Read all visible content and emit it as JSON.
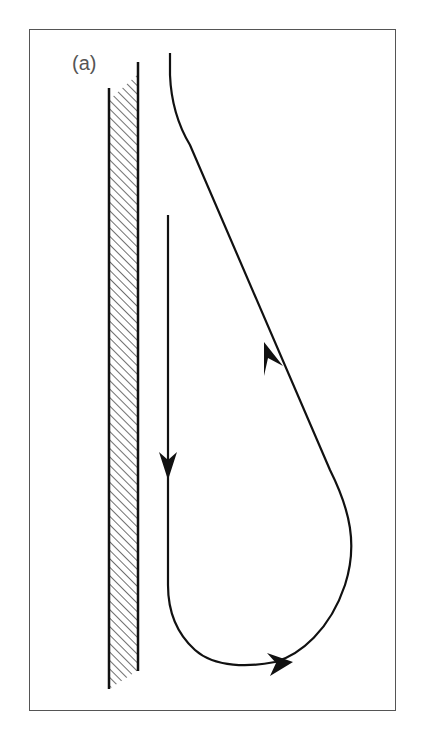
{
  "figure": {
    "panel_label": "(a)",
    "colors": {
      "stroke": "#111111",
      "frame": "#555555",
      "label": "#555555",
      "background": "#ffffff"
    },
    "elements": {
      "wall": "hatched-wall",
      "path": "teardrop-streamline",
      "arrows": [
        "arrow-down",
        "arrow-up-diagonal",
        "arrow-right-bottom"
      ]
    }
  }
}
